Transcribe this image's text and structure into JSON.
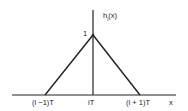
{
  "figure": {
    "function_label": "h",
    "function_sub": "i",
    "function_arg": "(x)",
    "peak_label": "1",
    "x_axis_label": "x",
    "ticks": [
      "(i −1)T",
      "iT",
      "(i + 1)T"
    ],
    "line_color": "#222222"
  }
}
